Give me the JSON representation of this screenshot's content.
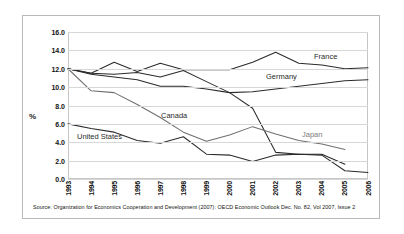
{
  "chart_data": {
    "type": "line",
    "title": "",
    "xlabel": "",
    "ylabel": "%",
    "ylim": [
      0.0,
      16.0
    ],
    "ytick_step": 2.0,
    "grid": true,
    "legend_position": "inline-labels",
    "categories": [
      "1993",
      "1994",
      "1995",
      "1996",
      "1997",
      "1998",
      "1999",
      "2000",
      "2001",
      "2002",
      "2003",
      "2004",
      "2005",
      "2006"
    ],
    "ytick_labels": [
      "0.0",
      "2.0",
      "4.0",
      "6.0",
      "8.0",
      "10.0",
      "12.0",
      "14.0",
      "16.0"
    ],
    "series": [
      {
        "name": "France",
        "label_color": "#2a2a2a",
        "values": [
          12.0,
          11.5,
          12.7,
          11.7,
          12.6,
          11.9,
          11.9,
          11.9,
          12.7,
          13.8,
          12.6,
          12.4,
          12.0,
          12.1
        ]
      },
      {
        "name": "Germany",
        "label_color": "#2a2a2a",
        "values": [
          12.0,
          11.4,
          11.1,
          10.8,
          10.1,
          10.1,
          9.8,
          9.4,
          9.5,
          9.8,
          10.1,
          10.4,
          10.7,
          10.8
        ]
      },
      {
        "name": "Canada",
        "label_color": "#2a2a2a",
        "values": [
          12.0,
          11.5,
          11.4,
          11.6,
          11.1,
          11.8,
          10.6,
          9.4,
          7.7,
          2.9,
          2.7,
          2.7,
          1.6,
          null
        ]
      },
      {
        "name": "Japan",
        "label_color": "#7a7a7a",
        "values": [
          12.0,
          9.6,
          9.4,
          8.1,
          6.7,
          5.1,
          4.1,
          4.8,
          5.7,
          4.9,
          4.2,
          3.8,
          3.2,
          null
        ]
      },
      {
        "name": "United States",
        "label_color": "#2a2a2a",
        "values": [
          6.0,
          5.5,
          5.1,
          4.2,
          3.9,
          4.6,
          2.7,
          2.6,
          1.9,
          2.6,
          2.7,
          2.6,
          0.9,
          0.7
        ]
      }
    ],
    "series_label_positions": [
      {
        "name": "France",
        "x_pct": 82.0,
        "y_value": 13.3
      },
      {
        "name": "Germany",
        "x_pct": 66.0,
        "y_value": 11.1
      },
      {
        "name": "Canada",
        "x_pct": 31.0,
        "y_value": 6.9
      },
      {
        "name": "Japan",
        "x_pct": 78.0,
        "y_value": 4.8
      },
      {
        "name": "United States",
        "x_pct": 3.0,
        "y_value": 4.6
      }
    ]
  },
  "source": {
    "text": "Source: Organization for Economics Cooperation and Development (2007): OECD Economic Outlook Dec. No. 82, Vol 2007, Issue 2"
  },
  "colors": {
    "line": "#2b2b2b",
    "line_muted": "#6f6f6f",
    "grid": "#d7d7d7",
    "frame": "#b9b9b9",
    "background": "#ffffff"
  }
}
